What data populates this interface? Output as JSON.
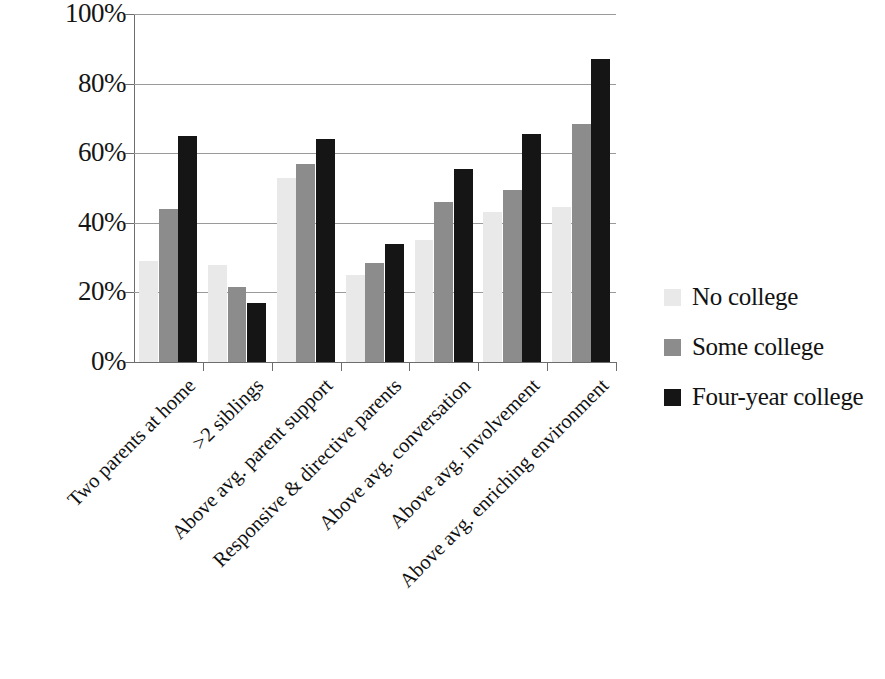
{
  "chart_data": {
    "type": "bar",
    "title": "",
    "subtitle": "",
    "xlabel": "",
    "ylabel": "",
    "ylim": [
      0,
      100
    ],
    "ytick_labels": [
      "100%",
      "80%",
      "60%",
      "40%",
      "20%",
      "0%"
    ],
    "ytick_values": [
      100,
      80,
      60,
      40,
      20,
      0
    ],
    "grid": true,
    "legend_position": "right",
    "value_suffix": "%",
    "categories": [
      "Two parents at home",
      ">2 siblings",
      "Above avg. parent support",
      "Responsive & directive parents",
      "Above avg. conversation",
      "Above avg. involvement",
      "Above avg. enriching environment"
    ],
    "series": [
      {
        "name": "No college",
        "color": "#e9e9e9",
        "values": [
          29,
          28,
          53,
          25,
          35,
          43,
          44.5
        ]
      },
      {
        "name": "Some college",
        "color": "#8c8c8c",
        "values": [
          44,
          21.5,
          57,
          28.5,
          46,
          49.5,
          68.5
        ]
      },
      {
        "name": "Four-year college",
        "color": "#151515",
        "values": [
          65,
          17,
          64,
          34,
          55.5,
          65.5,
          87
        ]
      }
    ]
  }
}
